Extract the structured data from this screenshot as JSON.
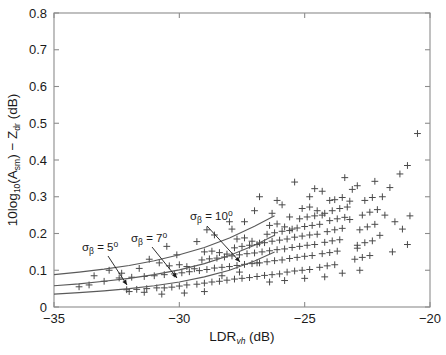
{
  "figure": {
    "background": "#ffffff",
    "frame_color": "#8c8c8c",
    "marker_color": "#4a4a4a",
    "curve_color": "#5a5a5a",
    "text_color": "#1a1a1a"
  },
  "axes": {
    "x": {
      "label_main": "LDR",
      "label_sub": "vh",
      "label_unit": " (dB)",
      "ticks": [
        "-35",
        "-30",
        "-25",
        "-20"
      ],
      "tickvalues": [
        -35,
        -30,
        -25,
        -20
      ],
      "min": -35,
      "max": -20
    },
    "y": {
      "label_prefix": "10log",
      "label_prefix_sub": "10",
      "label_open": "(A",
      "label_a_sub": "sm",
      "label_close": ") − Z",
      "label_z_sub": "dr",
      "label_unit": " (dB)",
      "ticks": [
        "0",
        "0.1",
        "0.2",
        "0.3",
        "0.4",
        "0.5",
        "0.6",
        "0.7",
        "0.8"
      ],
      "tickvalues": [
        0,
        0.1,
        0.2,
        0.3,
        0.4,
        0.5,
        0.6,
        0.7,
        0.8
      ],
      "min": 0,
      "max": 0.8
    }
  },
  "annotations": [
    {
      "name": "sigma-beta-5",
      "sigma": "σ",
      "sub": "β",
      "eq": " = 5",
      "deg": "o",
      "text_x": 82,
      "text_y": 251,
      "arrow": [
        [
          108,
          256
        ],
        [
          127,
          285
        ]
      ]
    },
    {
      "name": "sigma-beta-7",
      "sigma": "σ",
      "sub": "β",
      "eq": " = 7",
      "deg": "o",
      "text_x": 131,
      "text_y": 242,
      "arrow": [
        [
          152,
          247
        ],
        [
          177,
          278
        ]
      ]
    },
    {
      "name": "sigma-beta-10",
      "sigma": "σ",
      "sub": "β",
      "eq": " = 10",
      "deg": "o",
      "text_x": 190,
      "text_y": 220,
      "arrow": [
        [
          207,
          226
        ],
        [
          240,
          262
        ]
      ]
    }
  ],
  "chart_data": {
    "type": "scatter",
    "title": "",
    "xlabel": "LDR_vh (dB)",
    "ylabel": "10log10(A_sm) - Z_dr (dB)",
    "xlim": [
      -35,
      -20
    ],
    "ylim": [
      0,
      0.8
    ],
    "grid": false,
    "legend": "none",
    "marker": "+",
    "series": [
      {
        "name": "observations",
        "points": [
          [
            -32.1,
            0.047
          ],
          [
            -31.7,
            0.048
          ],
          [
            -31.3,
            0.05
          ],
          [
            -30.9,
            0.052
          ],
          [
            -32.4,
            0.079
          ],
          [
            -31.9,
            0.081
          ],
          [
            -31.4,
            0.083
          ],
          [
            -31.0,
            0.085
          ],
          [
            -30.6,
            0.052
          ],
          [
            -30.3,
            0.054
          ],
          [
            -30.0,
            0.057
          ],
          [
            -29.7,
            0.06
          ],
          [
            -30.6,
            0.088
          ],
          [
            -30.2,
            0.09
          ],
          [
            -29.9,
            0.093
          ],
          [
            -29.6,
            0.096
          ],
          [
            -30.4,
            0.112
          ],
          [
            -30.0,
            0.115
          ],
          [
            -29.7,
            0.11
          ],
          [
            -29.4,
            0.104
          ],
          [
            -29.3,
            0.062
          ],
          [
            -29.0,
            0.065
          ],
          [
            -28.7,
            0.068
          ],
          [
            -28.4,
            0.07
          ],
          [
            -29.2,
            0.099
          ],
          [
            -28.9,
            0.102
          ],
          [
            -28.6,
            0.106
          ],
          [
            -28.3,
            0.108
          ],
          [
            -29.1,
            0.128
          ],
          [
            -28.8,
            0.131
          ],
          [
            -28.5,
            0.133
          ],
          [
            -28.2,
            0.136
          ],
          [
            -29.0,
            0.15
          ],
          [
            -28.7,
            0.152
          ],
          [
            -28.4,
            0.148
          ],
          [
            -28.1,
            0.144
          ],
          [
            -28.1,
            0.073
          ],
          [
            -27.8,
            0.076
          ],
          [
            -27.5,
            0.078
          ],
          [
            -27.2,
            0.08
          ],
          [
            -28.0,
            0.11
          ],
          [
            -27.7,
            0.113
          ],
          [
            -27.4,
            0.116
          ],
          [
            -27.1,
            0.118
          ],
          [
            -27.9,
            0.139
          ],
          [
            -27.6,
            0.142
          ],
          [
            -27.3,
            0.145
          ],
          [
            -27.0,
            0.147
          ],
          [
            -27.8,
            0.161
          ],
          [
            -27.5,
            0.165
          ],
          [
            -27.2,
            0.168
          ],
          [
            -26.9,
            0.17
          ],
          [
            -27.7,
            0.185
          ],
          [
            -27.4,
            0.188
          ],
          [
            -27.1,
            0.179
          ],
          [
            -26.8,
            0.174
          ],
          [
            -26.9,
            0.083
          ],
          [
            -26.6,
            0.086
          ],
          [
            -26.3,
            0.088
          ],
          [
            -26.0,
            0.09
          ],
          [
            -26.8,
            0.12
          ],
          [
            -26.5,
            0.123
          ],
          [
            -26.2,
            0.126
          ],
          [
            -25.9,
            0.128
          ],
          [
            -26.7,
            0.15
          ],
          [
            -26.4,
            0.153
          ],
          [
            -26.1,
            0.156
          ],
          [
            -25.8,
            0.158
          ],
          [
            -26.6,
            0.175
          ],
          [
            -26.3,
            0.179
          ],
          [
            -26.0,
            0.182
          ],
          [
            -25.7,
            0.185
          ],
          [
            -26.5,
            0.198
          ],
          [
            -26.2,
            0.202
          ],
          [
            -25.9,
            0.206
          ],
          [
            -25.6,
            0.208
          ],
          [
            -26.4,
            0.222
          ],
          [
            -26.1,
            0.226
          ],
          [
            -25.8,
            0.218
          ],
          [
            -25.5,
            0.212
          ],
          [
            -25.7,
            0.095
          ],
          [
            -25.4,
            0.098
          ],
          [
            -25.1,
            0.1
          ],
          [
            -24.8,
            0.102
          ],
          [
            -25.6,
            0.132
          ],
          [
            -25.3,
            0.135
          ],
          [
            -25.0,
            0.138
          ],
          [
            -24.7,
            0.14
          ],
          [
            -25.5,
            0.162
          ],
          [
            -25.2,
            0.165
          ],
          [
            -24.9,
            0.168
          ],
          [
            -24.6,
            0.17
          ],
          [
            -25.4,
            0.19
          ],
          [
            -25.1,
            0.193
          ],
          [
            -24.8,
            0.196
          ],
          [
            -24.5,
            0.198
          ],
          [
            -25.3,
            0.215
          ],
          [
            -25.0,
            0.219
          ],
          [
            -24.7,
            0.222
          ],
          [
            -24.4,
            0.225
          ],
          [
            -25.2,
            0.24
          ],
          [
            -24.9,
            0.245
          ],
          [
            -24.6,
            0.248
          ],
          [
            -24.3,
            0.25
          ],
          [
            -25.1,
            0.268
          ],
          [
            -24.8,
            0.272
          ],
          [
            -24.5,
            0.262
          ],
          [
            -24.2,
            0.255
          ],
          [
            -24.4,
            0.108
          ],
          [
            -24.1,
            0.112
          ],
          [
            -23.8,
            0.115
          ],
          [
            -24.3,
            0.145
          ],
          [
            -24.0,
            0.148
          ],
          [
            -23.7,
            0.152
          ],
          [
            -24.2,
            0.176
          ],
          [
            -23.9,
            0.18
          ],
          [
            -23.6,
            0.183
          ],
          [
            -24.1,
            0.205
          ],
          [
            -23.8,
            0.21
          ],
          [
            -23.5,
            0.214
          ],
          [
            -24.0,
            0.235
          ],
          [
            -23.7,
            0.24
          ],
          [
            -23.4,
            0.244
          ],
          [
            -23.9,
            0.262
          ],
          [
            -23.6,
            0.268
          ],
          [
            -23.3,
            0.272
          ],
          [
            -23.8,
            0.292
          ],
          [
            -23.5,
            0.298
          ],
          [
            -23.2,
            0.288
          ],
          [
            -23.0,
            0.13
          ],
          [
            -22.7,
            0.135
          ],
          [
            -22.4,
            0.14
          ],
          [
            -22.9,
            0.168
          ],
          [
            -22.6,
            0.175
          ],
          [
            -22.3,
            0.18
          ],
          [
            -22.8,
            0.21
          ],
          [
            -22.5,
            0.218
          ],
          [
            -22.2,
            0.225
          ],
          [
            -22.7,
            0.25
          ],
          [
            -22.4,
            0.258
          ],
          [
            -22.1,
            0.265
          ],
          [
            -22.6,
            0.29
          ],
          [
            -22.3,
            0.298
          ],
          [
            -23.1,
            0.32
          ],
          [
            -22.9,
            0.33
          ],
          [
            -24.6,
            0.322
          ],
          [
            -24.3,
            0.315
          ],
          [
            -25.9,
            0.278
          ],
          [
            -26.3,
            0.255
          ],
          [
            -27.4,
            0.232
          ],
          [
            -27.9,
            0.212
          ],
          [
            -28.6,
            0.196
          ],
          [
            -29.3,
            0.178
          ],
          [
            -30.1,
            0.142
          ],
          [
            -30.8,
            0.12
          ],
          [
            -31.6,
            0.105
          ],
          [
            -32.3,
            0.092
          ],
          [
            -33.0,
            0.07
          ],
          [
            -33.6,
            0.06
          ],
          [
            -21.9,
            0.3
          ],
          [
            -21.6,
            0.325
          ],
          [
            -21.2,
            0.362
          ],
          [
            -20.9,
            0.385
          ],
          [
            -22.2,
            0.342
          ],
          [
            -23.4,
            0.352
          ],
          [
            -25.4,
            0.34
          ],
          [
            -26.8,
            0.3
          ],
          [
            -20.5,
            0.472
          ],
          [
            -21.4,
            0.232
          ],
          [
            -22.0,
            0.195
          ],
          [
            -22.9,
            0.16
          ],
          [
            -24.0,
            0.29
          ],
          [
            -20.8,
            0.248
          ],
          [
            -21.1,
            0.212
          ],
          [
            -21.8,
            0.25
          ],
          [
            -23.2,
            0.238
          ],
          [
            -24.8,
            0.3
          ],
          [
            -25.6,
            0.245
          ],
          [
            -26.1,
            0.29
          ],
          [
            -27.0,
            0.262
          ],
          [
            -28.0,
            0.232
          ],
          [
            -28.9,
            0.21
          ],
          [
            -30.5,
            0.165
          ],
          [
            -31.2,
            0.13
          ],
          [
            -32.8,
            0.1
          ],
          [
            -33.4,
            0.085
          ],
          [
            -34.0,
            0.055
          ],
          [
            -26.9,
            0.12
          ],
          [
            -27.6,
            0.095
          ],
          [
            -28.3,
            0.085
          ],
          [
            -29.0,
            0.042
          ],
          [
            -29.8,
            0.038
          ],
          [
            -30.7,
            0.035
          ],
          [
            -31.4,
            0.04
          ],
          [
            -32.0,
            0.042
          ],
          [
            -24.2,
            0.082
          ],
          [
            -25.0,
            0.078
          ],
          [
            -25.8,
            0.072
          ],
          [
            -26.4,
            0.068
          ],
          [
            -23.5,
            0.092
          ],
          [
            -22.8,
            0.1
          ],
          [
            -21.5,
            0.15
          ],
          [
            -20.9,
            0.17
          ]
        ]
      }
    ],
    "curves": [
      {
        "name": "sigma_beta_5deg",
        "sigma_beta_deg": 5,
        "x": [
          -35,
          -34,
          -33,
          -32,
          -31,
          -30,
          -29,
          -28,
          -27,
          -26.2
        ],
        "y": [
          0.035,
          0.039,
          0.044,
          0.05,
          0.058,
          0.068,
          0.082,
          0.1,
          0.125,
          0.15
        ]
      },
      {
        "name": "sigma_beta_7deg",
        "sigma_beta_deg": 7,
        "x": [
          -35,
          -34,
          -33,
          -32,
          -31,
          -30,
          -29,
          -28,
          -27,
          -26.2
        ],
        "y": [
          0.058,
          0.063,
          0.07,
          0.078,
          0.088,
          0.101,
          0.118,
          0.14,
          0.168,
          0.195
        ]
      },
      {
        "name": "sigma_beta_10deg",
        "sigma_beta_deg": 10,
        "x": [
          -35,
          -34,
          -33,
          -32,
          -31,
          -30,
          -29,
          -28,
          -27,
          -26.2
        ],
        "y": [
          0.088,
          0.095,
          0.103,
          0.113,
          0.126,
          0.142,
          0.162,
          0.188,
          0.22,
          0.248
        ]
      }
    ],
    "annotations": [
      {
        "text": "sigma_beta = 5 deg"
      },
      {
        "text": "sigma_beta = 7 deg"
      },
      {
        "text": "sigma_beta = 10 deg"
      }
    ]
  }
}
